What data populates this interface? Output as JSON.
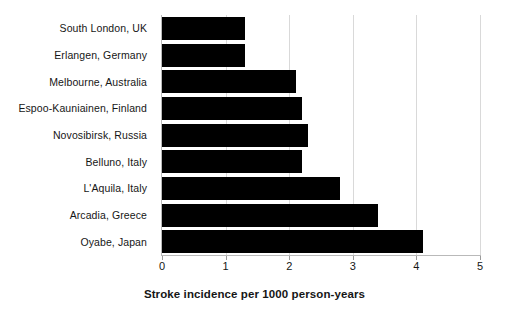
{
  "chart_data": {
    "type": "bar",
    "orientation": "horizontal",
    "title": "",
    "xlabel": "Stroke incidence per 1000 person-years",
    "ylabel": "",
    "categories": [
      "South London, UK",
      "Erlangen, Germany",
      "Melbourne, Australia",
      "Espoo-Kauniainen, Finland",
      "Novosibirsk, Russia",
      "Belluno, Italy",
      "L'Aquila, Italy",
      "Arcadia, Greece",
      "Oyabe, Japan"
    ],
    "values": [
      1.3,
      1.3,
      2.1,
      2.2,
      2.3,
      2.2,
      2.8,
      3.4,
      4.1
    ],
    "xlim": [
      0,
      5
    ],
    "xticks": [
      0,
      1,
      2,
      3,
      4,
      5
    ],
    "xtick_labels": [
      "0",
      "1",
      "2",
      "3",
      "4",
      "5"
    ],
    "grid": "vertical",
    "legend": "none",
    "bar_color": "#000000",
    "gridline_color": "#d9d9d9",
    "axis_color": "#b9b9b9",
    "background_color": "#ffffff"
  }
}
